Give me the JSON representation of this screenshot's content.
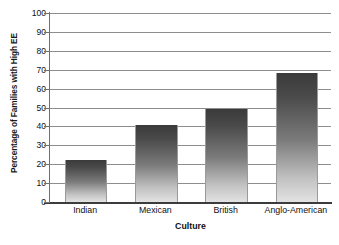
{
  "chart_data": {
    "type": "bar",
    "title": "",
    "xlabel": "Culture",
    "ylabel": "Percentage of Families with High EE",
    "categories": [
      "Indian",
      "Mexican",
      "British",
      "Anglo-American"
    ],
    "values": [
      22,
      41,
      49,
      68
    ],
    "ylim": [
      0,
      100
    ],
    "yticks": [
      0,
      10,
      20,
      30,
      40,
      50,
      60,
      70,
      80,
      90,
      100
    ],
    "ytick_labels": [
      "0",
      "10",
      "20",
      "30",
      "40",
      "50",
      "60",
      "70",
      "80",
      "90",
      "100"
    ],
    "grid": true,
    "legend": "none",
    "bar_color_top": "#3a3a3a",
    "bar_color_bottom": "#e2e2e2",
    "gridline_color": "#8e8e8e",
    "axis_color": "#3c3c3c",
    "text_color": "#111111",
    "background": "#ffffff"
  }
}
